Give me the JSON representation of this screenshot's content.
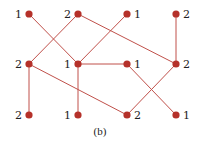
{
  "caption": "(b)",
  "colors": {
    "node": "#b5312a",
    "edge": "#c0504a",
    "text": "#222222",
    "background": "#ffffff"
  },
  "nodes": [
    {
      "id": "r1c1",
      "x": 29,
      "y": 14,
      "label": "1",
      "label_side": "left"
    },
    {
      "id": "r1c2",
      "x": 78,
      "y": 14,
      "label": "2",
      "label_side": "left"
    },
    {
      "id": "r1c3",
      "x": 127,
      "y": 14,
      "label": "1",
      "label_side": "right"
    },
    {
      "id": "r1c4",
      "x": 176,
      "y": 14,
      "label": "2",
      "label_side": "right"
    },
    {
      "id": "r2c1",
      "x": 29,
      "y": 64,
      "label": "2",
      "label_side": "left"
    },
    {
      "id": "r2c2",
      "x": 78,
      "y": 64,
      "label": "1",
      "label_side": "left"
    },
    {
      "id": "r2c3",
      "x": 127,
      "y": 64,
      "label": "1",
      "label_side": "right"
    },
    {
      "id": "r2c4",
      "x": 176,
      "y": 64,
      "label": "2",
      "label_side": "right"
    },
    {
      "id": "r3c1",
      "x": 29,
      "y": 115,
      "label": "2",
      "label_side": "left"
    },
    {
      "id": "r3c2",
      "x": 78,
      "y": 115,
      "label": "1",
      "label_side": "left"
    },
    {
      "id": "r3c3",
      "x": 127,
      "y": 115,
      "label": "2",
      "label_side": "right"
    },
    {
      "id": "r3c4",
      "x": 176,
      "y": 115,
      "label": "1",
      "label_side": "right"
    }
  ],
  "edges": [
    [
      "r1c1",
      "r2c2"
    ],
    [
      "r1c2",
      "r2c1"
    ],
    [
      "r1c2",
      "r2c4"
    ],
    [
      "r1c3",
      "r2c2"
    ],
    [
      "r1c4",
      "r2c4"
    ],
    [
      "r2c2",
      "r2c3"
    ],
    [
      "r2c1",
      "r3c1"
    ],
    [
      "r2c1",
      "r3c3"
    ],
    [
      "r2c2",
      "r3c2"
    ],
    [
      "r2c3",
      "r3c4"
    ],
    [
      "r2c4",
      "r3c3"
    ]
  ]
}
